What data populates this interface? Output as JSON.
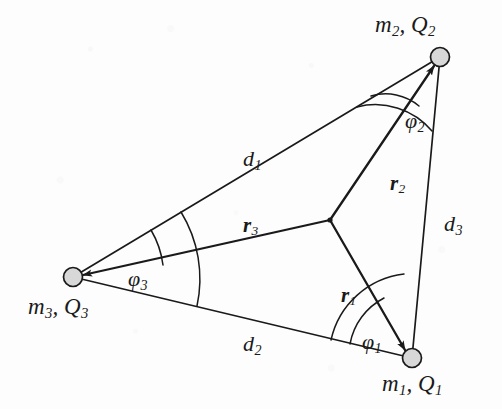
{
  "figure": {
    "domain_note": "physics vector diagram",
    "background_color": "#fdfdfd",
    "ink_color": "#1a1a1a",
    "node_fill_color": "#d8d8d8"
  },
  "masses": [
    {
      "id": "m1",
      "label_mass": "m",
      "label_mass_sub": "1",
      "label_charge": "Q",
      "label_charge_sub": "1",
      "label_text": "m1, Q1",
      "x": 412,
      "y": 358
    },
    {
      "id": "m2",
      "label_mass": "m",
      "label_mass_sub": "2",
      "label_charge": "Q",
      "label_charge_sub": "2",
      "label_text": "m2, Q2",
      "x": 440,
      "y": 57
    },
    {
      "id": "m3",
      "label_mass": "m",
      "label_mass_sub": "3",
      "label_charge": "Q",
      "label_charge_sub": "3",
      "label_text": "m3, Q3",
      "x": 73,
      "y": 277
    }
  ],
  "centroid": {
    "label": "",
    "x": 330,
    "y": 220
  },
  "distances": [
    {
      "id": "d1",
      "symbol": "d",
      "sub": "1",
      "from": "m3",
      "to": "m2",
      "label_x": 243,
      "label_y": 148
    },
    {
      "id": "d2",
      "symbol": "d",
      "sub": "2",
      "from": "m3",
      "to": "m1",
      "label_x": 243,
      "label_y": 333
    },
    {
      "id": "d3",
      "symbol": "d",
      "sub": "3",
      "from": "m2",
      "to": "m1",
      "label_x": 444,
      "label_y": 213
    }
  ],
  "vectors": [
    {
      "id": "r1",
      "symbol": "r",
      "sub": "1",
      "from": "centroid",
      "to": "m1",
      "label_x": 341,
      "label_y": 285
    },
    {
      "id": "r2",
      "symbol": "r",
      "sub": "2",
      "from": "centroid",
      "to": "m2",
      "label_x": 390,
      "label_y": 173
    },
    {
      "id": "r3",
      "symbol": "r",
      "sub": "3",
      "from": "centroid",
      "to": "m3",
      "label_x": 243,
      "label_y": 215
    }
  ],
  "angles": [
    {
      "id": "phi1",
      "symbol": "φ",
      "sub": "1",
      "vertex": "m1",
      "label_x": 362,
      "label_y": 331
    },
    {
      "id": "phi2",
      "symbol": "φ",
      "sub": "2",
      "vertex": "m2",
      "label_x": 405,
      "label_y": 110
    },
    {
      "id": "phi3",
      "symbol": "φ",
      "sub": "3",
      "vertex": "m3",
      "label_x": 128,
      "label_y": 268
    }
  ]
}
